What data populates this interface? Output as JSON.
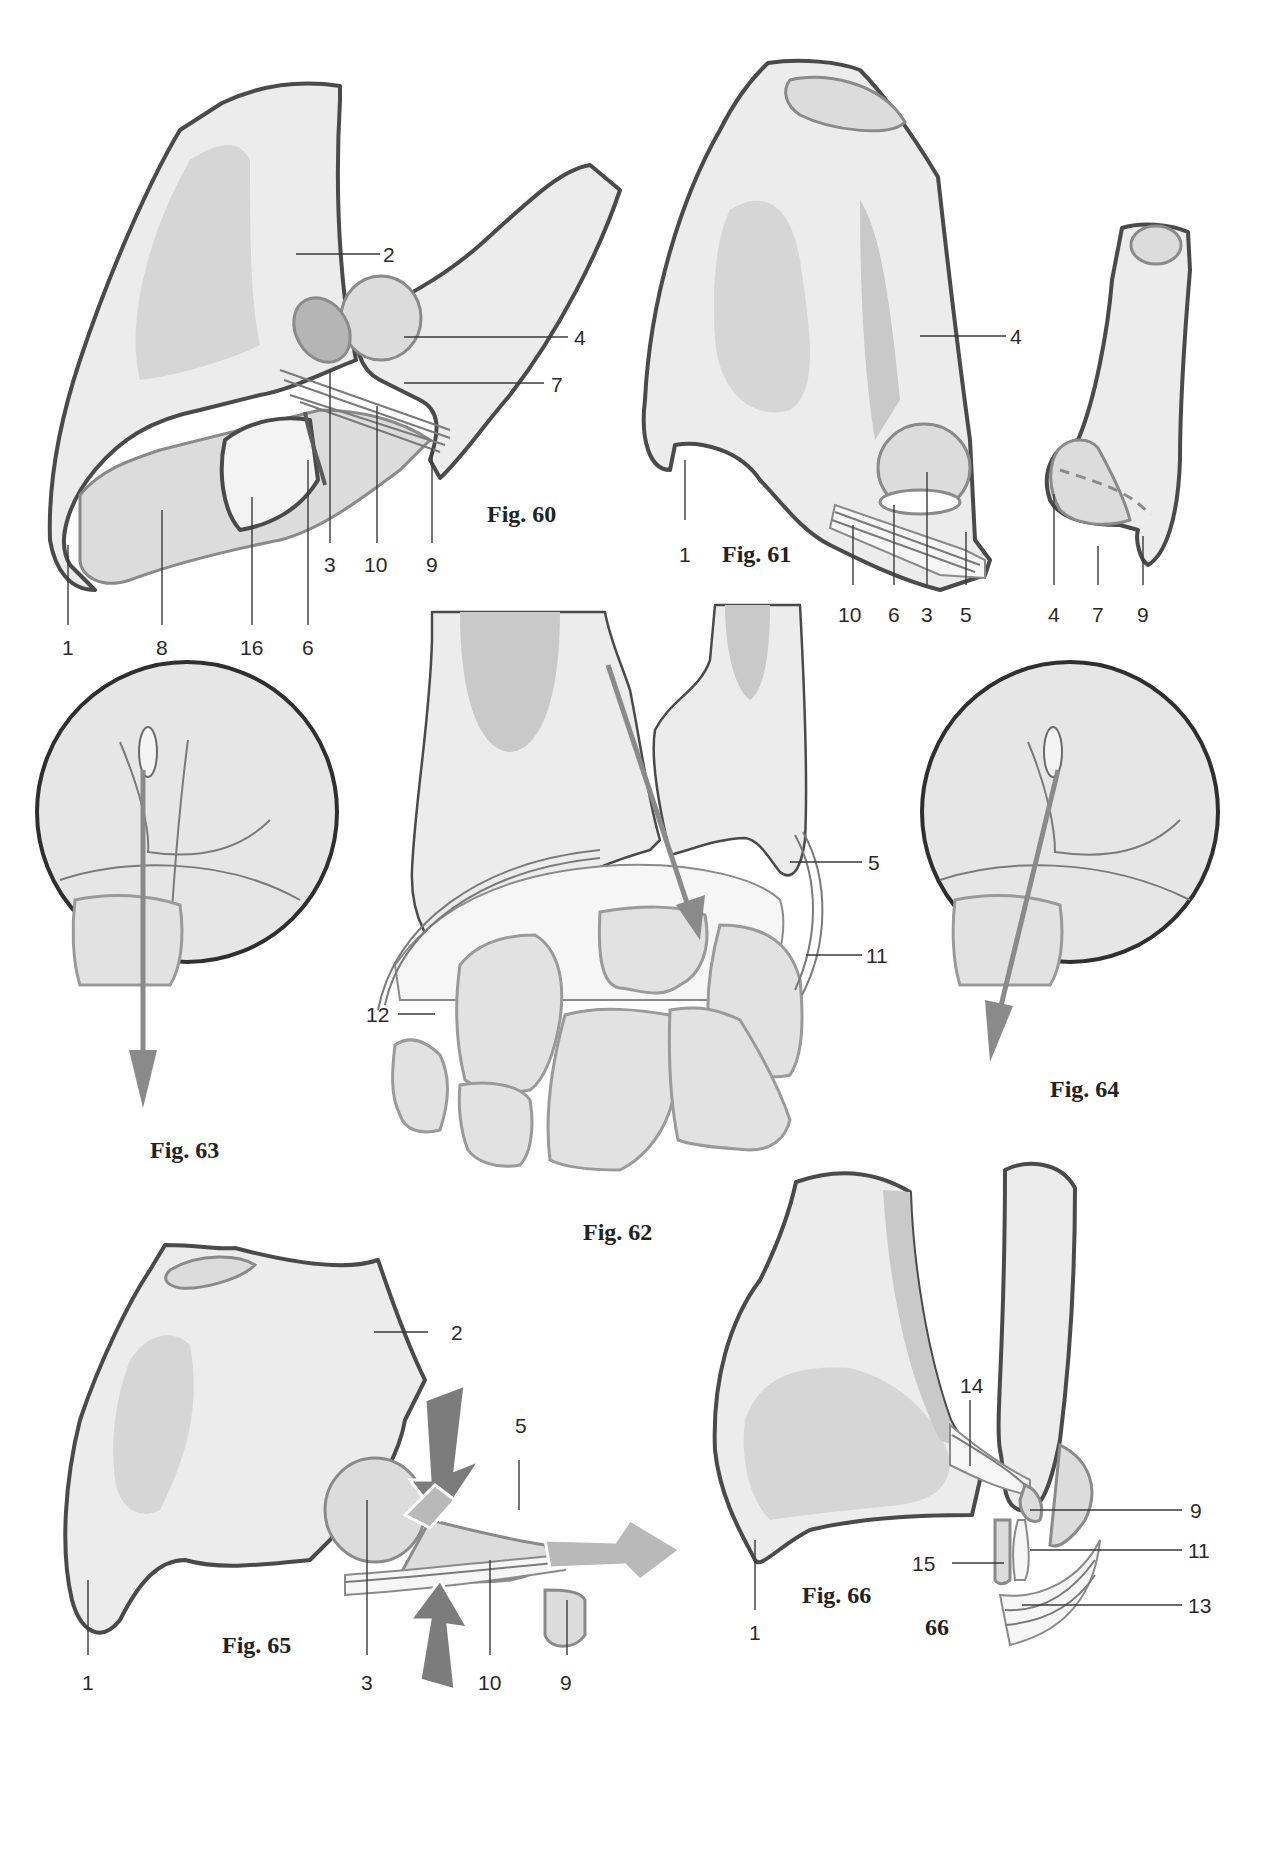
{
  "page": {
    "page_number": "66"
  },
  "figures": [
    {
      "id": "fig60",
      "caption": "Fig. 60",
      "labels": [
        "1",
        "2",
        "3",
        "4",
        "6",
        "7",
        "8",
        "9",
        "10",
        "16"
      ]
    },
    {
      "id": "fig61",
      "caption": "Fig. 61",
      "labels": [
        "1",
        "4",
        "10",
        "6",
        "3",
        "5",
        "4",
        "7",
        "9"
      ]
    },
    {
      "id": "fig62",
      "caption": "Fig. 62",
      "labels": [
        "5",
        "11",
        "12"
      ]
    },
    {
      "id": "fig63",
      "caption": "Fig. 63",
      "labels": []
    },
    {
      "id": "fig64",
      "caption": "Fig. 64",
      "labels": []
    },
    {
      "id": "fig65",
      "caption": "Fig. 65",
      "labels": [
        "2",
        "5",
        "1",
        "3",
        "10",
        "9"
      ]
    },
    {
      "id": "fig66",
      "caption": "Fig. 66",
      "labels": [
        "14",
        "9",
        "11",
        "15",
        "13",
        "1"
      ]
    }
  ],
  "colors": {
    "bone_fill": "#ececec",
    "outline": "#4a4a4a",
    "cartilage": "#dcdcdc",
    "arrow": "#8a8a8a"
  }
}
